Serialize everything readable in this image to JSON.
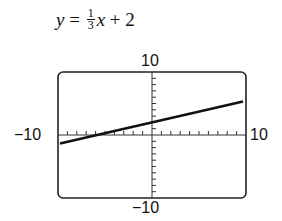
{
  "chart_data": {
    "type": "line",
    "equation": {
      "lhs": "y",
      "eq": " = ",
      "numerator": "1",
      "denominator": "3",
      "var": "x",
      "rest": " + 2"
    },
    "xlim": [
      -10,
      10
    ],
    "ylim": [
      -10,
      10
    ],
    "tick_labels": {
      "top": "10",
      "bottom": "−10",
      "left": "−10",
      "right": "10"
    },
    "grid": false,
    "axis_ticks": "every 1 unit",
    "series": [
      {
        "name": "y = (1/3)x + 2",
        "x": [
          -10,
          10
        ],
        "y": [
          -1.333,
          5.333
        ]
      }
    ],
    "colors": {
      "line": "#111111",
      "frame": "#222222"
    }
  }
}
